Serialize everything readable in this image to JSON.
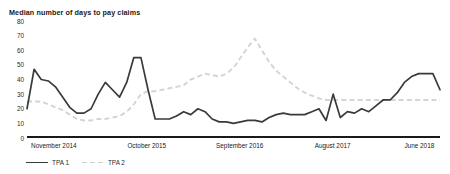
{
  "chart_data": {
    "type": "line",
    "title": "Median number of days to pay claims",
    "xlabel": "",
    "ylabel": "",
    "ylim": [
      0,
      80
    ],
    "yticks": [
      80,
      70,
      60,
      50,
      40,
      30,
      20,
      10,
      0
    ],
    "grid": false,
    "legend_position": "bottom-left",
    "xtick_labels": [
      "November 2014",
      "October 2015",
      "September 2016",
      "August 2017",
      "June 2018"
    ],
    "xtick_positions_pct": [
      6.5,
      29.0,
      51.5,
      74.0,
      95.0
    ],
    "colors": {
      "tpa1": "#3a3a3a",
      "tpa2": "#d4d4d4",
      "axis": "#1a1a1a",
      "background": "#ffffff"
    },
    "series": [
      {
        "name": "TPA 1",
        "style": "solid",
        "color": "#3a3a3a",
        "values": [
          20,
          47,
          40,
          39,
          35,
          28,
          21,
          17,
          17,
          20,
          30,
          38,
          33,
          28,
          38,
          55,
          55,
          33,
          13,
          13,
          13,
          15,
          18,
          16,
          20,
          18,
          13,
          11,
          11,
          10,
          11,
          12,
          12,
          11,
          14,
          16,
          17,
          16,
          16,
          16,
          18,
          20,
          12,
          30,
          14,
          18,
          17,
          20,
          18,
          22,
          26,
          26,
          31,
          38,
          42,
          44,
          44,
          44,
          33
        ]
      },
      {
        "name": "TPA 2",
        "style": "dashed",
        "color": "#d4d4d4",
        "values": [
          25,
          25,
          25,
          23,
          21,
          19,
          16,
          13,
          12,
          12,
          13,
          13,
          14,
          15,
          18,
          23,
          30,
          32,
          32,
          33,
          34,
          35,
          36,
          40,
          42,
          44,
          43,
          42,
          44,
          48,
          55,
          62,
          68,
          60,
          52,
          46,
          42,
          38,
          34,
          31,
          29,
          27,
          26,
          26,
          26,
          26,
          26,
          26,
          26,
          26,
          26,
          26,
          26,
          26,
          26,
          26,
          26,
          26,
          26
        ]
      }
    ]
  },
  "legend": {
    "items": [
      {
        "label": "TPA 1",
        "style": "solid"
      },
      {
        "label": "TPA 2",
        "style": "dashed"
      }
    ]
  }
}
